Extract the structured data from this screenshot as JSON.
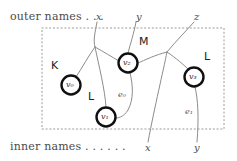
{
  "figure": {
    "type": "bigraph-diagram",
    "outer_caption": "outer names . . .",
    "inner_caption": "inner names . . . . . .",
    "outer_names": [
      {
        "label": "x",
        "x": 96,
        "y": 17
      },
      {
        "label": "y",
        "x": 136,
        "y": 17
      },
      {
        "label": "z",
        "x": 194,
        "y": 17
      }
    ],
    "inner_names": [
      {
        "label": "x",
        "x": 147,
        "y": 148
      },
      {
        "label": "y",
        "x": 196,
        "y": 148
      }
    ],
    "nodes": [
      {
        "id": "v0",
        "label": "v₀",
        "control": "K",
        "cx": 71,
        "cy": 85,
        "r": 9.5
      },
      {
        "id": "v1",
        "label": "v₁",
        "control": "L",
        "cx": 106,
        "cy": 117,
        "r": 9.5
      },
      {
        "id": "v2",
        "label": "v₂",
        "control": "M",
        "cx": 128,
        "cy": 63,
        "r": 9.5
      },
      {
        "id": "v3",
        "label": "v₃",
        "control": "L",
        "cx": 194,
        "cy": 77,
        "r": 9.5
      }
    ],
    "control_labels": [
      {
        "text": "K",
        "x": 51,
        "y": 66
      },
      {
        "text": "L",
        "x": 88,
        "y": 97
      },
      {
        "text": "M",
        "x": 140,
        "y": 42
      },
      {
        "text": "L",
        "x": 205,
        "y": 57
      }
    ],
    "edge_labels": [
      {
        "text": "e₀",
        "x": 121,
        "y": 95
      },
      {
        "text": "e₁",
        "x": 188,
        "y": 112
      }
    ],
    "place_region": {
      "x": 42,
      "y": 28,
      "width": 182,
      "height": 101,
      "style": "dotted",
      "color": "#8a8a8a"
    },
    "colors": {
      "node_stroke": "#101010",
      "node_fill": "#ffffff",
      "link_stroke": "#8c8c8c",
      "region_stroke": "#9a9a9a",
      "text": "#3a3a3a"
    }
  }
}
